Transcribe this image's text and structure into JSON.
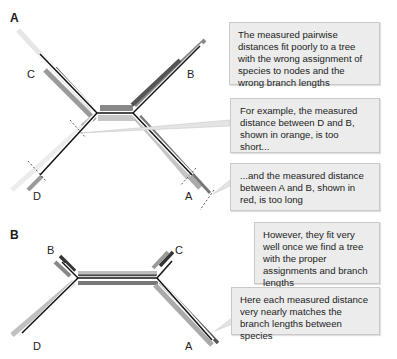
{
  "panels": {
    "a": {
      "label": "A",
      "leaves": {
        "c": "C",
        "b": "B",
        "d": "D",
        "a": "A"
      },
      "callouts": [
        "The measured pairwise distances fit poorly to a tree with the wrong assignment of species to nodes and the wrong branch lengths",
        "For example, the measured distance between D and B, shown in orange, is too short...",
        "...and the measured distance between A and B, shown in red, is too long"
      ]
    },
    "b": {
      "label": "B",
      "leaves": {
        "b": "B",
        "c": "C",
        "d": "D",
        "a": "A"
      },
      "callouts": [
        "However, they fit very well once we find a tree with the proper assignments and branch lengths",
        "Here each measured distance very nearly matches the branch lengths between species"
      ]
    }
  },
  "colors": {
    "branch": "#111111",
    "measured_dark": "#555555",
    "measured_mid": "#8a8a8a",
    "measured_light": "#c4c4c4",
    "callout_bg": "#ececec",
    "callout_border": "#c9c9c9"
  }
}
